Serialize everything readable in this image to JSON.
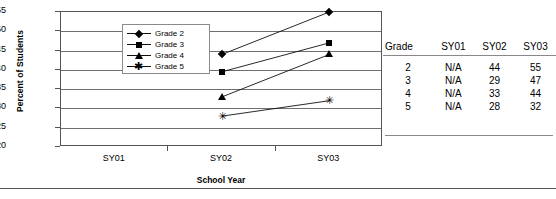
{
  "chart_data": {
    "type": "line",
    "title": "",
    "xlabel": "School Year",
    "ylabel": "Percent of Students",
    "categories": [
      "SY01",
      "SY02",
      "SY03"
    ],
    "ylim": [
      20,
      55
    ],
    "yticks": [
      20,
      25,
      30,
      35,
      40,
      45,
      50,
      55
    ],
    "grid": true,
    "legend_position": "upper-left-inside",
    "series": [
      {
        "name": "Grade 2",
        "marker": "diamond",
        "values": [
          null,
          44,
          55
        ]
      },
      {
        "name": "Grade 3",
        "marker": "square",
        "values": [
          null,
          39.5,
          47
        ]
      },
      {
        "name": "Grade 4",
        "marker": "triangle",
        "values": [
          null,
          33,
          44
        ]
      },
      {
        "name": "Grade 5",
        "marker": "star",
        "values": [
          null,
          28,
          32
        ]
      }
    ]
  },
  "axis": {
    "y_title": "Percent of Students",
    "x_title": "School Year",
    "y_tick_labels": [
      "55",
      "50",
      "45",
      "40",
      "35",
      "30",
      "25",
      "20"
    ],
    "x_tick_labels": [
      "SY01",
      "SY02",
      "SY03"
    ]
  },
  "legend": {
    "items": [
      {
        "label": "Grade 2",
        "marker": "diamond"
      },
      {
        "label": "Grade 3",
        "marker": "square"
      },
      {
        "label": "Grade 4",
        "marker": "triangle"
      },
      {
        "label": "Grade 5",
        "marker": "star"
      }
    ]
  },
  "table": {
    "headers": [
      "Grade",
      "SY01",
      "SY02",
      "SY03"
    ],
    "rows": [
      [
        "2",
        "N/A",
        "44",
        "55"
      ],
      [
        "3",
        "N/A",
        "29",
        "47"
      ],
      [
        "4",
        "N/A",
        "33",
        "44"
      ],
      [
        "5",
        "N/A",
        "28",
        "32"
      ]
    ]
  }
}
